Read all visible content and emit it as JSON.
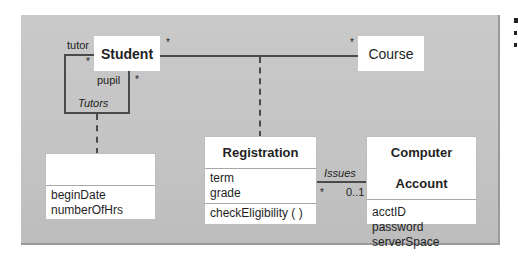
{
  "diagram": {
    "type": "UML class diagram",
    "classes": {
      "student": {
        "name": "Student"
      },
      "course": {
        "name": "Course"
      },
      "tutors_class": {
        "name": "",
        "attributes": [
          "beginDate",
          "numberOfHrs"
        ]
      },
      "registration": {
        "name": "Registration",
        "attributes": [
          "term",
          "grade"
        ],
        "operations": [
          "checkEligibility ( )"
        ]
      },
      "computer_account": {
        "name": "Computer Account",
        "attributes": [
          "acctID",
          "password",
          "serverSpace"
        ]
      }
    },
    "associations": {
      "tutors": {
        "name": "Tutors",
        "role_a": "tutor",
        "role_b": "pupil",
        "mult_a": "*",
        "mult_b": "*"
      },
      "student_course": {
        "mult_student": "*",
        "mult_course": "*"
      },
      "issues": {
        "name": "Issues",
        "mult_registration": "*",
        "mult_account": "0..1"
      }
    }
  }
}
